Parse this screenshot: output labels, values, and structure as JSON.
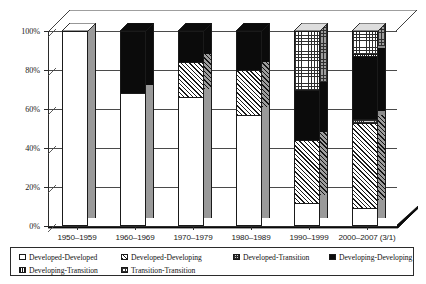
{
  "chart_data": {
    "type": "bar",
    "subtype": "stacked-percent-3d",
    "title": "",
    "xlabel": "",
    "ylabel": "",
    "ylim": [
      0,
      100
    ],
    "ytick_labels": [
      "0%",
      "20%",
      "40%",
      "60%",
      "80%",
      "100%"
    ],
    "ytick_values": [
      0,
      20,
      40,
      60,
      80,
      100
    ],
    "grid": true,
    "legend_position": "bottom",
    "categories": [
      "1950–1959",
      "1960–1969",
      "1970–1979",
      "1980–1989",
      "1990–1999",
      "2000–2007 (3/1)"
    ],
    "series": [
      {
        "name": "Developed-Developed",
        "pattern": "white",
        "values": [
          100,
          68,
          66,
          57,
          12,
          9
        ]
      },
      {
        "name": "Developed-Developing",
        "pattern": "hatch",
        "values": [
          0,
          0,
          18,
          23,
          32,
          44
        ]
      },
      {
        "name": "Developed-Transition",
        "pattern": "dot",
        "values": [
          0,
          0,
          0,
          0,
          0,
          2
        ]
      },
      {
        "name": "Developing-Developing",
        "pattern": "black",
        "values": [
          0,
          32,
          16,
          20,
          26,
          32
        ]
      },
      {
        "name": "Developing-Transition",
        "pattern": "vstripe",
        "values": [
          0,
          0,
          0,
          0,
          0,
          1
        ]
      },
      {
        "name": "Transition-Transition",
        "pattern": "grid",
        "values": [
          0,
          0,
          0,
          0,
          30,
          12
        ]
      }
    ]
  },
  "legend": {
    "items": [
      {
        "label": "Developed-Developed",
        "pattern": "white"
      },
      {
        "label": "Developed-Developing",
        "pattern": "grid"
      },
      {
        "label": "Developed-Transition",
        "pattern": "dot"
      },
      {
        "label": "Developing-Developing",
        "pattern": "black"
      },
      {
        "label": "Developing-Transition",
        "pattern": "vstripe"
      },
      {
        "label": "Transition-Transition",
        "pattern": "grid-light"
      }
    ]
  }
}
